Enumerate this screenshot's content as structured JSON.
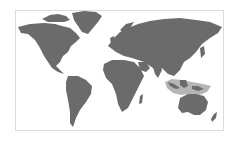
{
  "map": {
    "type": "world-map",
    "projection": "miller-like",
    "colors": {
      "background": "#ffffff",
      "land": "#6b6b6b",
      "highlight": "#b5b5b5",
      "frame": "#dcdcdc"
    },
    "highlighted_region": "Maritime Southeast Asia / Wallacea (Indonesia, New Guinea, northern Australia waters)"
  }
}
